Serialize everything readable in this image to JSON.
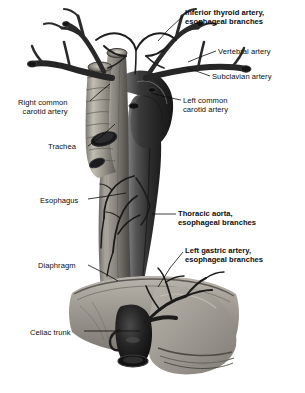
{
  "figure": {
    "style": "grayscale anatomical illustration",
    "background_color": "#ffffff",
    "ink_color": "#0d0d0d",
    "width": 305,
    "height": 393
  },
  "labels": [
    {
      "id": "inferior-thyroid-artery",
      "line1": "Inferior thyroid artery,",
      "line2": "esophageal branches",
      "bold": true,
      "align": "left",
      "x": 185,
      "y": 8,
      "leader": [
        [
          183,
          16
        ],
        [
          168,
          30
        ],
        [
          158,
          41
        ]
      ]
    },
    {
      "id": "vertebral-artery",
      "line1": "Vertebral artery",
      "line2": "",
      "bold": false,
      "align": "left",
      "x": 218,
      "y": 47,
      "leader": [
        [
          216,
          51
        ],
        [
          200,
          57
        ],
        [
          188,
          62
        ]
      ]
    },
    {
      "id": "subclavian-artery",
      "line1": "Subclavian artery",
      "line2": "",
      "bold": false,
      "align": "left",
      "x": 212,
      "y": 72,
      "leader": [
        [
          210,
          76
        ],
        [
          196,
          71
        ],
        [
          186,
          68
        ]
      ]
    },
    {
      "id": "right-common-carotid-artery",
      "line1": "Right common",
      "line2": "carotid artery",
      "bold": false,
      "align": "right",
      "x": 18,
      "y": 98,
      "leader": [
        [
          90,
          101
        ],
        [
          100,
          92
        ],
        [
          110,
          84
        ]
      ]
    },
    {
      "id": "left-common-carotid-artery",
      "line1": "Left common",
      "line2": "carotid artery",
      "bold": false,
      "align": "left",
      "x": 183,
      "y": 96,
      "leader": [
        [
          181,
          100
        ],
        [
          166,
          97
        ],
        [
          151,
          93
        ]
      ]
    },
    {
      "id": "trachea",
      "line1": "Trachea",
      "line2": "",
      "bold": false,
      "align": "right",
      "x": 48,
      "y": 142,
      "leader": [
        [
          88,
          146
        ],
        [
          102,
          136
        ],
        [
          115,
          124
        ]
      ]
    },
    {
      "id": "esophagus",
      "line1": "Esophagus",
      "line2": "",
      "bold": false,
      "align": "right",
      "x": 40,
      "y": 196,
      "leader": [
        [
          88,
          199
        ],
        [
          108,
          196
        ],
        [
          126,
          193
        ]
      ]
    },
    {
      "id": "thoracic-aorta",
      "line1": "Thoracic aorta,",
      "line2": "esophageal branches",
      "bold": true,
      "align": "left",
      "x": 178,
      "y": 209,
      "leader": [
        [
          176,
          214
        ],
        [
          164,
          214
        ],
        [
          152,
          214
        ]
      ]
    },
    {
      "id": "left-gastric-artery",
      "line1": "Left gastric artery,",
      "line2": "esophageal branches",
      "bold": true,
      "align": "left",
      "x": 185,
      "y": 246,
      "leader": [
        [
          183,
          252
        ],
        [
          170,
          268
        ],
        [
          158,
          287
        ]
      ]
    },
    {
      "id": "diaphragm",
      "line1": "Diaphragm",
      "line2": "",
      "bold": false,
      "align": "right",
      "x": 38,
      "y": 261,
      "leader": [
        [
          88,
          265
        ],
        [
          104,
          273
        ],
        [
          118,
          281
        ]
      ]
    },
    {
      "id": "celiac-trunk",
      "line1": "Celiac trunk",
      "line2": "",
      "bold": false,
      "align": "right",
      "x": 30,
      "y": 328,
      "leader": [
        [
          84,
          331
        ],
        [
          112,
          331
        ],
        [
          140,
          331
        ]
      ]
    }
  ]
}
